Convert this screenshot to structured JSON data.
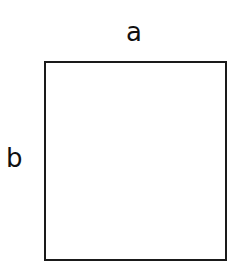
{
  "diagram": {
    "shape": "rectangle",
    "labels": {
      "top": "a",
      "left": "b"
    },
    "stroke_color": "#1a1a1a",
    "background": "#ffffff"
  }
}
